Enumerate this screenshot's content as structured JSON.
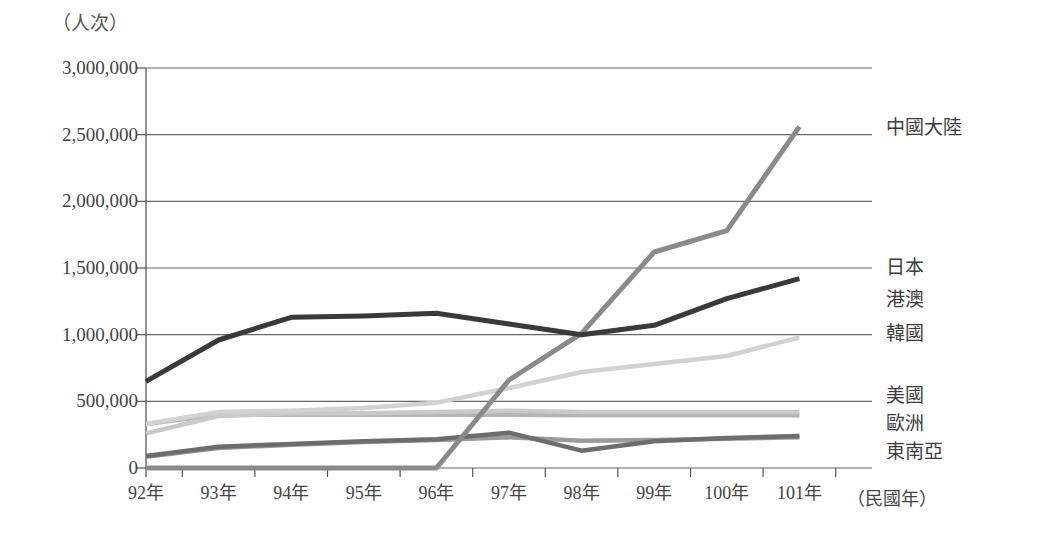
{
  "axis": {
    "y_unit_label": "（人次）",
    "x_unit_label": "（民國年）",
    "y_ticks": [
      "3,000,000",
      "2,500,000",
      "2,000,000",
      "1,500,000",
      "1,000,000",
      "500,000",
      "0"
    ],
    "x_ticks": [
      "92年",
      "93年",
      "94年",
      "95年",
      "96年",
      "97年",
      "98年",
      "99年",
      "100年",
      "101年"
    ]
  },
  "series_labels": {
    "china": "中國大陸",
    "japan": "日本",
    "hkmacau": "港澳",
    "korea": "韓國",
    "usa": "美國",
    "europe": "歐洲",
    "seasia": "東南亞"
  },
  "colors": {
    "china": "#8a8a8a",
    "japan": "#3a3a3a",
    "hkmacau": "#d2d2d2",
    "korea": "#c9c9c9",
    "usa": "#b4b4b4",
    "europe": "#6d6d6d",
    "seasia": "#9a9a9a",
    "axis": "#555555",
    "grid": "#666666"
  },
  "chart_data": {
    "type": "line",
    "title": "",
    "xlabel": "（民國年）",
    "ylabel": "（人次）",
    "ylim": [
      0,
      3000000
    ],
    "xlim": [
      91.5,
      101.5
    ],
    "grid": true,
    "legend": "right-inline-labels",
    "x": [
      91.5,
      92.5,
      93.5,
      94.5,
      95.5,
      96.5,
      97.5,
      98.5,
      99.5,
      100.5
    ],
    "series": [
      {
        "name": "中國大陸",
        "key": "china",
        "values": [
          0,
          0,
          0,
          0,
          0,
          660000,
          1010000,
          1620000,
          1780000,
          2560000
        ]
      },
      {
        "name": "日本",
        "key": "japan",
        "values": [
          650000,
          960000,
          1130000,
          1140000,
          1160000,
          1080000,
          1000000,
          1070000,
          1270000,
          1420000
        ]
      },
      {
        "name": "港澳",
        "key": "hkmacau",
        "values": [
          330000,
          420000,
          430000,
          450000,
          490000,
          600000,
          720000,
          780000,
          840000,
          980000
        ]
      },
      {
        "name": "韓國",
        "key": "korea",
        "values": [
          260000,
          390000,
          410000,
          410000,
          420000,
          430000,
          420000,
          420000,
          420000,
          420000
        ]
      },
      {
        "name": "美國",
        "key": "usa",
        "values": [
          330000,
          400000,
          400000,
          400000,
          400000,
          400000,
          395000,
          395000,
          395000,
          395000
        ]
      },
      {
        "name": "歐洲",
        "key": "europe",
        "values": [
          90000,
          160000,
          180000,
          200000,
          215000,
          265000,
          130000,
          200000,
          225000,
          240000
        ]
      },
      {
        "name": "東南亞",
        "key": "seasia",
        "values": [
          85000,
          150000,
          175000,
          195000,
          210000,
          230000,
          205000,
          210000,
          220000,
          230000
        ]
      }
    ]
  },
  "series_label_positions": {
    "china_y": 128,
    "japan_y": 268,
    "hkmacau_y": 300,
    "korea_y": 334,
    "usa_y": 396,
    "europe_y": 424,
    "seasia_y": 452
  }
}
